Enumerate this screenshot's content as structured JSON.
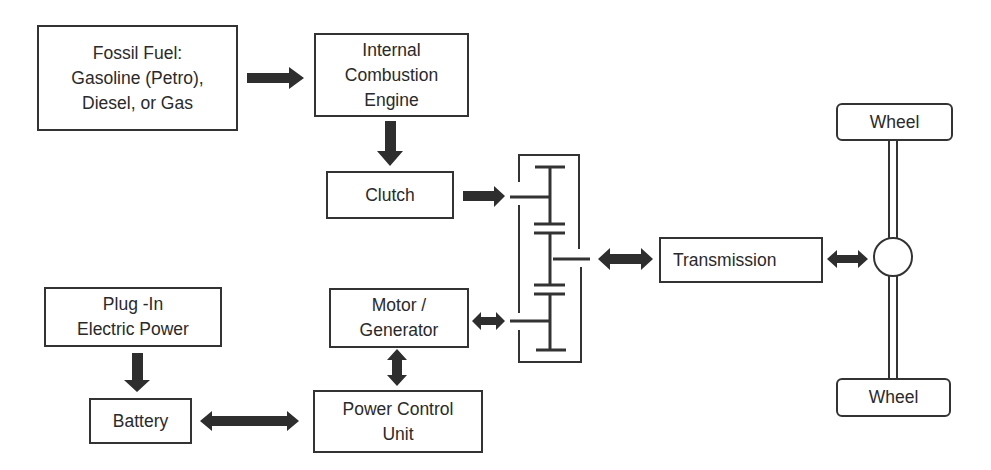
{
  "diagram": {
    "title": "",
    "nodes": [
      {
        "id": "fossil_fuel",
        "label": "Fossil Fuel:\nGasoline (Petro),\nDiesel, or Gas"
      },
      {
        "id": "ice",
        "label": "Internal\nCombustion\nEngine"
      },
      {
        "id": "clutch",
        "label": "Clutch"
      },
      {
        "id": "plug_in",
        "label": "Plug -In\nElectric Power"
      },
      {
        "id": "battery",
        "label": "Battery"
      },
      {
        "id": "motor_generator",
        "label": "Motor /\nGenerator"
      },
      {
        "id": "pcu",
        "label": "Power Control\nUnit"
      },
      {
        "id": "transmission",
        "label": "Transmission"
      },
      {
        "id": "wheel_top",
        "label": "Wheel"
      },
      {
        "id": "wheel_bottom",
        "label": "Wheel"
      }
    ],
    "edges": [
      {
        "from": "fossil_fuel",
        "to": "ice",
        "type": "one-way"
      },
      {
        "from": "ice",
        "to": "clutch",
        "type": "one-way"
      },
      {
        "from": "clutch",
        "to": "gearset",
        "type": "one-way"
      },
      {
        "from": "gearset",
        "to": "transmission",
        "type": "two-way"
      },
      {
        "from": "transmission",
        "to": "axle",
        "type": "two-way"
      },
      {
        "from": "plug_in",
        "to": "battery",
        "type": "one-way"
      },
      {
        "from": "battery",
        "to": "pcu",
        "type": "two-way"
      },
      {
        "from": "pcu",
        "to": "motor_generator",
        "type": "two-way"
      },
      {
        "from": "motor_generator",
        "to": "gearset",
        "type": "two-way"
      }
    ],
    "colors": {
      "line": "#333333",
      "arrow": "#2e2e2e",
      "background": "#ffffff"
    }
  }
}
